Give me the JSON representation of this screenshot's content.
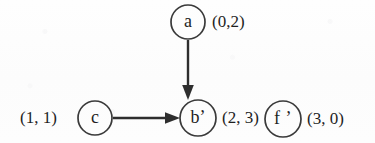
{
  "diagram": {
    "type": "directed-graph",
    "title": "",
    "background_color": "#fdfdfd",
    "ink_color": "#2e2e2e",
    "nodes": [
      {
        "id": "a",
        "label": "a",
        "coord_label": "(0,2)",
        "cx": 188,
        "cy": 22,
        "r": 17
      },
      {
        "id": "c",
        "label": "c",
        "coord_label": "(1, 1)",
        "cx": 95,
        "cy": 118,
        "r": 17
      },
      {
        "id": "b-prime",
        "label": "b’",
        "coord_label": "(2, 3)",
        "cx": 198,
        "cy": 118,
        "r": 18
      },
      {
        "id": "f-prime",
        "label": "f ’",
        "coord_label": "(3, 0)",
        "cx": 283,
        "cy": 119,
        "r": 18
      }
    ],
    "edges": [
      {
        "id": "a-to-b",
        "from": "a",
        "to": "b-prime",
        "direction": "down"
      },
      {
        "id": "c-to-b",
        "from": "c",
        "to": "b-prime",
        "direction": "right"
      }
    ]
  }
}
